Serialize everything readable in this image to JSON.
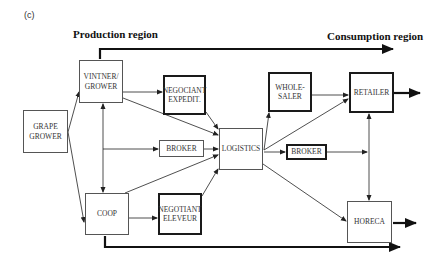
{
  "panel_label": "(c)",
  "regions": {
    "production": "Production region",
    "consumption": "Consumption region"
  },
  "nodes": {
    "grape_grower": "GRAPE\nGROWER",
    "vintner_grower": "VINTNER/\nGROWER",
    "coop": "COOP",
    "negociant_expedit": "NEGOCIANT\nEXPEDIT.",
    "broker_production": "BROKER",
    "negotiant_eleveur": "NEGOTIANT\nELEVEUR",
    "logistics": "LOGISTICS",
    "wholesaler": "WHOLE-\nSALER",
    "broker_consumption": "BROKER",
    "retailer": "RETAILER",
    "horeca": "HORECA"
  },
  "edges": [
    {
      "from": "grape_grower",
      "to": "vintner_grower"
    },
    {
      "from": "grape_grower",
      "to": "coop"
    },
    {
      "from": "vintner_grower",
      "to": "coop",
      "bidirectional": true
    },
    {
      "from": "vintner_grower",
      "to": "negociant_expedit"
    },
    {
      "from": "vintner_grower",
      "to": "logistics"
    },
    {
      "from": "vintner_coop_link",
      "to": "broker_production"
    },
    {
      "from": "coop",
      "to": "negotiant_eleveur"
    },
    {
      "from": "coop",
      "to": "logistics"
    },
    {
      "from": "negociant_expedit",
      "to": "logistics"
    },
    {
      "from": "broker_production",
      "to": "logistics"
    },
    {
      "from": "negotiant_eleveur",
      "to": "logistics"
    },
    {
      "from": "logistics",
      "to": "wholesaler"
    },
    {
      "from": "logistics",
      "to": "retailer"
    },
    {
      "from": "logistics",
      "to": "broker_consumption"
    },
    {
      "from": "logistics",
      "to": "horeca"
    },
    {
      "from": "wholesaler",
      "to": "retailer"
    },
    {
      "from": "broker_consumption",
      "to": "retailer_horeca_link"
    },
    {
      "from": "retailer",
      "to": "horeca",
      "bidirectional": true
    },
    {
      "from": "retailer",
      "to": "out",
      "thick": true
    },
    {
      "from": "horeca",
      "to": "out",
      "thick": true
    },
    {
      "from": "vintner_grower",
      "to": "consumption_region",
      "thick": true
    },
    {
      "from": "coop",
      "to": "consumption_region",
      "thick": true
    }
  ]
}
